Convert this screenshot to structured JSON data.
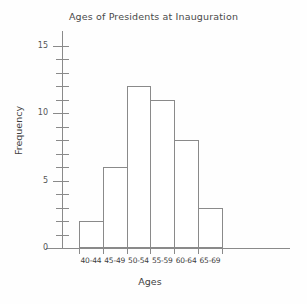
{
  "chart_data": {
    "type": "bar",
    "title": "Ages of Presidents at Inauguration",
    "xlabel": "Ages",
    "ylabel": "Frequency",
    "categories": [
      "40-44",
      "45-49",
      "50-54",
      "55-59",
      "60-64",
      "65-69"
    ],
    "values": [
      2,
      6,
      12,
      11,
      8,
      3
    ],
    "ylim": [
      0,
      15
    ],
    "y_major_ticks": [
      0,
      5,
      10,
      15
    ],
    "y_major_tick_labels": [
      "0",
      "5",
      "10",
      "15"
    ],
    "y_minor_tick_step": 1,
    "grid": false,
    "legend": "none",
    "bar_fill_color": "#ffffff",
    "bar_edge_color": "#8a8a8a",
    "axis_color": "#8a8a8a",
    "text_color": "#3f3f3f",
    "background_color": "#fefefe"
  }
}
